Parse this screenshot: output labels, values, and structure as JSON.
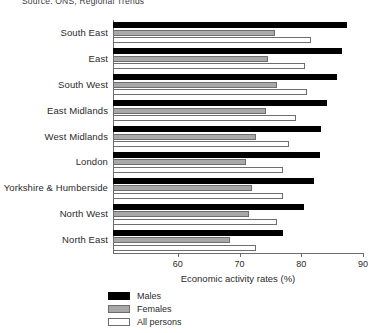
{
  "source_note": "Source: ONS, Regional Trends",
  "chart_data": {
    "type": "bar",
    "orientation": "horizontal",
    "title": "",
    "xlabel": "Economic activity rates (%)",
    "ylabel": "",
    "xlim": [
      49.5,
      90
    ],
    "xticks": [
      60,
      70,
      80,
      90
    ],
    "xtick_labels": [
      "60",
      "70",
      "80",
      "90"
    ],
    "grid": false,
    "legend_position": "bottom-left",
    "categories": [
      "South East",
      "East",
      "South West",
      "East Midlands",
      "West Midlands",
      "London",
      "Yorkshire & Humberside",
      "North West",
      "North East"
    ],
    "series": [
      {
        "name": "Males",
        "color": "#000000",
        "values": [
          87.4,
          86.6,
          85.8,
          84.1,
          83.2,
          83.0,
          82.1,
          80.5,
          77.0
        ]
      },
      {
        "name": "Females",
        "color": "#a8a8a8",
        "values": [
          75.8,
          74.6,
          76.0,
          74.3,
          72.7,
          71.1,
          72.0,
          71.6,
          68.4
        ]
      },
      {
        "name": "All persons",
        "color": "#ffffff",
        "values": [
          81.6,
          80.6,
          80.9,
          79.2,
          78.0,
          77.1,
          77.1,
          76.1,
          72.7
        ]
      }
    ]
  },
  "legend": {
    "items": [
      {
        "label": "Males"
      },
      {
        "label": "Females"
      },
      {
        "label": "All persons"
      }
    ]
  }
}
